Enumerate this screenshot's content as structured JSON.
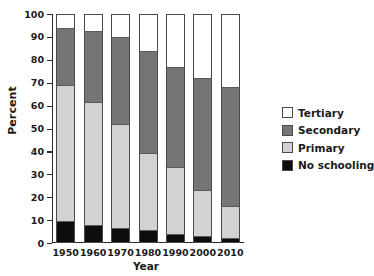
{
  "chart_data": {
    "type": "bar",
    "subtype": "stacked-bar-100-percent",
    "title": "",
    "xlabel": "Year",
    "ylabel": "Percent",
    "categories": [
      "1950",
      "1960",
      "1970",
      "1980",
      "1990",
      "2000",
      "2010"
    ],
    "ylim": [
      0,
      100
    ],
    "yticks": [
      0,
      10,
      20,
      30,
      40,
      50,
      60,
      70,
      80,
      90,
      100
    ],
    "ytick_labels": [
      "0",
      "10",
      "20",
      "30",
      "40",
      "50",
      "60",
      "70",
      "80",
      "90",
      "100"
    ],
    "grid": false,
    "legend_position": "right",
    "stack_order_bottom_to_top": [
      "No schooling",
      "Primary",
      "Secondary",
      "Tertiary"
    ],
    "series": [
      {
        "name": "No schooling",
        "color": "#0d0d0d",
        "values": [
          9.5,
          8.0,
          6.5,
          5.5,
          4.0,
          3.0,
          2.0
        ]
      },
      {
        "name": "Primary",
        "color": "#d2d2d2",
        "values": [
          59.5,
          53.5,
          45.5,
          34.0,
          29.0,
          20.0,
          14.0
        ]
      },
      {
        "name": "Secondary",
        "color": "#757575",
        "values": [
          25.0,
          31.0,
          38.0,
          44.5,
          44.0,
          49.0,
          52.0
        ]
      },
      {
        "name": "Tertiary",
        "color": "#ffffff",
        "values": [
          6.0,
          7.5,
          10.0,
          16.0,
          23.0,
          28.0,
          32.0
        ]
      }
    ],
    "cumulative_tops": {
      "no_schooling": [
        9.5,
        8.0,
        6.5,
        5.5,
        4.0,
        3.0,
        2.0
      ],
      "primary": [
        69.0,
        61.5,
        52.0,
        39.5,
        33.0,
        23.0,
        16.0
      ],
      "secondary": [
        94.0,
        92.5,
        90.0,
        84.0,
        77.0,
        72.0,
        68.0
      ],
      "tertiary": [
        100,
        100,
        100,
        100,
        100,
        100,
        100
      ]
    }
  },
  "legend": {
    "items": [
      {
        "label": "Tertiary",
        "color": "#ffffff"
      },
      {
        "label": "Secondary",
        "color": "#757575"
      },
      {
        "label": "Primary",
        "color": "#d2d2d2"
      },
      {
        "label": "No schooling",
        "color": "#0d0d0d"
      }
    ]
  }
}
